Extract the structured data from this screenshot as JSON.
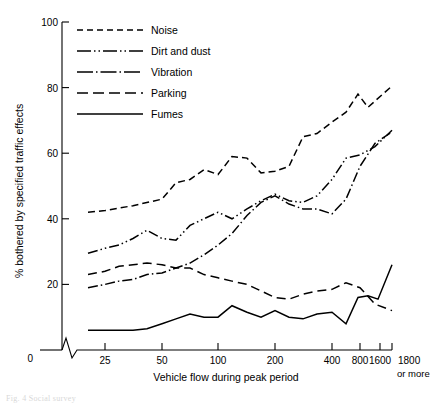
{
  "chart_data": {
    "type": "line",
    "title": "",
    "xlabel": "Vehicle flow during peak period",
    "ylabel": "% bothered by specified traffic effects",
    "x_tick_labels": [
      "0",
      "25",
      "50",
      "100",
      "200",
      "400",
      "800",
      "1600",
      "1800"
    ],
    "x_axis_note": "or more",
    "y_tick_labels": [
      "0",
      "20",
      "40",
      "60",
      "80",
      "100"
    ],
    "ylim": [
      0,
      100
    ],
    "grid": false,
    "axis_break": true,
    "legend_position": "top-left-inside",
    "x_positions": [
      88,
      105,
      133,
      162,
      190,
      218,
      247,
      275,
      303,
      332,
      360,
      375,
      392
    ],
    "series": [
      {
        "name": "Noise",
        "dash": "7,4",
        "values": [
          42,
          42.5,
          43.5,
          45.5,
          50.5,
          52,
          54.5,
          53.5,
          59,
          58.5,
          54,
          54.5,
          56,
          65,
          66,
          70,
          72.5,
          77.5,
          74,
          80.5
        ],
        "points": [
          [
            88,
            42
          ],
          [
            105,
            42.5
          ],
          [
            133,
            44
          ],
          [
            162,
            46
          ],
          [
            176,
            51
          ],
          [
            190,
            52
          ],
          [
            204,
            55
          ],
          [
            218,
            53.5
          ],
          [
            232,
            59
          ],
          [
            247,
            58.5
          ],
          [
            261,
            54
          ],
          [
            275,
            54.5
          ],
          [
            289,
            56
          ],
          [
            303,
            65
          ],
          [
            317,
            66
          ],
          [
            332,
            69.5
          ],
          [
            346,
            72.5
          ],
          [
            358,
            78
          ],
          [
            368,
            74
          ],
          [
            392,
            80.5
          ]
        ]
      },
      {
        "name": "Dirt and dust",
        "dash": "10,3,1.5,3,1.5,3",
        "points": [
          [
            88,
            29.5
          ],
          [
            105,
            31
          ],
          [
            119,
            32
          ],
          [
            133,
            34
          ],
          [
            147,
            36.5
          ],
          [
            162,
            34
          ],
          [
            176,
            33.5
          ],
          [
            190,
            38
          ],
          [
            204,
            40
          ],
          [
            218,
            42
          ],
          [
            232,
            40
          ],
          [
            247,
            43
          ],
          [
            261,
            45.5
          ],
          [
            275,
            47.5
          ],
          [
            289,
            45.5
          ],
          [
            303,
            45
          ],
          [
            317,
            47
          ],
          [
            332,
            52
          ],
          [
            346,
            58.5
          ],
          [
            360,
            59.5
          ],
          [
            375,
            62
          ],
          [
            392,
            67
          ]
        ]
      },
      {
        "name": "Vibration",
        "dash": "10,3,1.5,3",
        "points": [
          [
            88,
            19
          ],
          [
            105,
            20
          ],
          [
            119,
            21
          ],
          [
            133,
            21.5
          ],
          [
            147,
            23
          ],
          [
            162,
            23.5
          ],
          [
            176,
            25
          ],
          [
            190,
            26.5
          ],
          [
            204,
            29
          ],
          [
            218,
            32
          ],
          [
            232,
            35.5
          ],
          [
            247,
            41
          ],
          [
            261,
            45
          ],
          [
            275,
            47
          ],
          [
            289,
            44.5
          ],
          [
            303,
            43
          ],
          [
            317,
            43
          ],
          [
            332,
            41.5
          ],
          [
            346,
            46
          ],
          [
            360,
            56
          ],
          [
            375,
            63
          ],
          [
            392,
            66.5
          ]
        ]
      },
      {
        "name": "Parking",
        "dash": "9,5",
        "points": [
          [
            88,
            23
          ],
          [
            105,
            24
          ],
          [
            119,
            25.5
          ],
          [
            133,
            26
          ],
          [
            147,
            26.5
          ],
          [
            162,
            26
          ],
          [
            176,
            25
          ],
          [
            190,
            25
          ],
          [
            204,
            23
          ],
          [
            218,
            22
          ],
          [
            232,
            21
          ],
          [
            247,
            20
          ],
          [
            261,
            18
          ],
          [
            275,
            16
          ],
          [
            289,
            15.5
          ],
          [
            303,
            17
          ],
          [
            317,
            18
          ],
          [
            332,
            18.5
          ],
          [
            346,
            20.5
          ],
          [
            360,
            19
          ],
          [
            375,
            14
          ],
          [
            392,
            12
          ]
        ]
      },
      {
        "name": "Fumes",
        "dash": "0",
        "points": [
          [
            88,
            6
          ],
          [
            105,
            6
          ],
          [
            133,
            6
          ],
          [
            147,
            6.5
          ],
          [
            162,
            8
          ],
          [
            176,
            9.5
          ],
          [
            190,
            11
          ],
          [
            204,
            10
          ],
          [
            218,
            10
          ],
          [
            232,
            13.5
          ],
          [
            247,
            11.5
          ],
          [
            261,
            10
          ],
          [
            275,
            12
          ],
          [
            289,
            10
          ],
          [
            303,
            9.5
          ],
          [
            317,
            11
          ],
          [
            332,
            11.5
          ],
          [
            346,
            8
          ],
          [
            358,
            16
          ],
          [
            368,
            16.5
          ],
          [
            378,
            15.5
          ],
          [
            392,
            26
          ]
        ]
      }
    ],
    "legend": [
      {
        "label": "Noise",
        "dash": "6,4"
      },
      {
        "label": "Dirt and dust",
        "dash": "14,3,1.5,3,1.5,3"
      },
      {
        "label": "Vibration",
        "dash": "16,3,1.5,3"
      },
      {
        "label": "Parking",
        "dash": "11,5"
      },
      {
        "label": "Fumes",
        "dash": "0"
      }
    ]
  },
  "caption": {
    "ghost_text": "Fig. 4  Social survey"
  }
}
